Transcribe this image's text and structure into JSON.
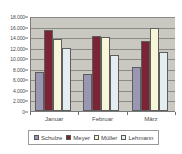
{
  "chart_data": {
    "type": "bar",
    "title": "",
    "xlabel": "",
    "ylabel": "",
    "ylim": [
      0,
      18000
    ],
    "ytick_step": 2000,
    "grid": true,
    "legend_position": "bottom",
    "categories": [
      "Januar",
      "Februar",
      "März"
    ],
    "ytick_labels": [
      "18.000",
      "16.000",
      "14.000",
      "12.000",
      "10.000",
      "8.000",
      "6.000",
      "4.000",
      "2.000",
      "0"
    ],
    "ytick_values": [
      18000,
      16000,
      14000,
      12000,
      10000,
      8000,
      6000,
      4000,
      2000,
      0
    ],
    "series": [
      {
        "name": "Schulze",
        "color": "#9a96b4",
        "values": [
          7400,
          7000,
          8300
        ]
      },
      {
        "name": "Meyer",
        "color": "#7b2436",
        "values": [
          15300,
          14200,
          13300
        ]
      },
      {
        "name": "Müller",
        "color": "#f7f7d8",
        "values": [
          13600,
          14100,
          15800
        ]
      },
      {
        "name": "Lehmann",
        "color": "#e4eef1",
        "values": [
          11900,
          10700,
          11100
        ]
      }
    ]
  },
  "colors": {
    "plot_background": "#c9c9c2",
    "gridline": "#8b8b85",
    "axis": "#7a7a7a",
    "page_background": "#ffffff",
    "text": "#4a4a4a"
  }
}
